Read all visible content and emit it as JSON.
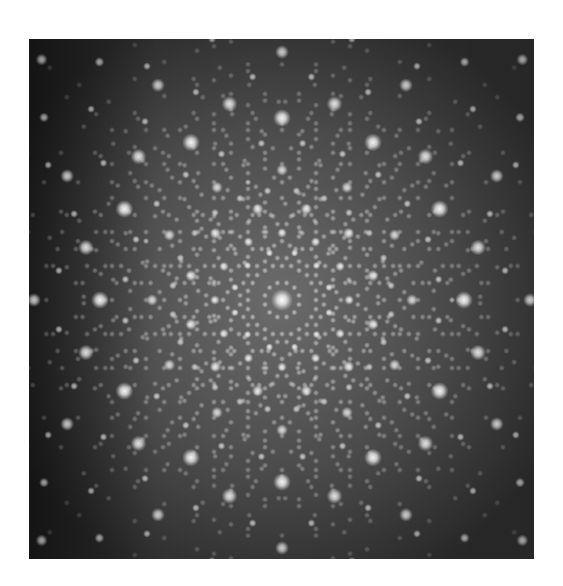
{
  "image": {
    "subject": "twelve-fold quasicrystal diffraction pattern",
    "frame": {
      "x": 29,
      "y": 39,
      "width": 505,
      "height": 520
    },
    "center": {
      "x": 253,
      "y": 261
    },
    "colors": {
      "page_background": "#ffffff",
      "edge_dark": "#222222",
      "field_mid": "#4a4a4a",
      "field_center": "#7a7a7a",
      "spot": "#f4f4f4"
    },
    "symmetry_order": 12,
    "rings": [
      {
        "radius": 0,
        "count": 1,
        "size": 11,
        "opacity": 1.0
      },
      {
        "radius": 182,
        "count": 12,
        "size": 9,
        "opacity": 0.95,
        "phase_deg": 0
      },
      {
        "radius": 203,
        "count": 12,
        "size": 8,
        "opacity": 0.85,
        "phase_deg": 15
      },
      {
        "radius": 248,
        "count": 12,
        "size": 7,
        "opacity": 0.75,
        "phase_deg": 0
      },
      {
        "radius": 94,
        "count": 12,
        "size": 6,
        "opacity": 0.85,
        "phase_deg": 15
      },
      {
        "radius": 67,
        "count": 12,
        "size": 5,
        "opacity": 0.8,
        "phase_deg": 0
      },
      {
        "radius": 130,
        "count": 12,
        "size": 6,
        "opacity": 0.8,
        "phase_deg": 0
      },
      {
        "radius": 49,
        "count": 12,
        "size": 4,
        "opacity": 0.75,
        "phase_deg": 15
      },
      {
        "radius": 158,
        "count": 24,
        "size": 4,
        "opacity": 0.7,
        "phase_deg": 7.5
      },
      {
        "radius": 110,
        "count": 24,
        "size": 4,
        "opacity": 0.7,
        "phase_deg": 7.5
      },
      {
        "radius": 225,
        "count": 24,
        "size": 4,
        "opacity": 0.65,
        "phase_deg": 7.5
      },
      {
        "radius": 270,
        "count": 24,
        "size": 4,
        "opacity": 0.6,
        "phase_deg": 0
      },
      {
        "radius": 300,
        "count": 24,
        "size": 5,
        "opacity": 0.6,
        "phase_deg": 7.5
      },
      {
        "radius": 340,
        "count": 12,
        "size": 6,
        "opacity": 0.6,
        "phase_deg": 15
      }
    ],
    "quasi_field": {
      "basis_length": 34,
      "levels": 5,
      "spot_size": 3.2,
      "opacity": 0.55
    }
  }
}
